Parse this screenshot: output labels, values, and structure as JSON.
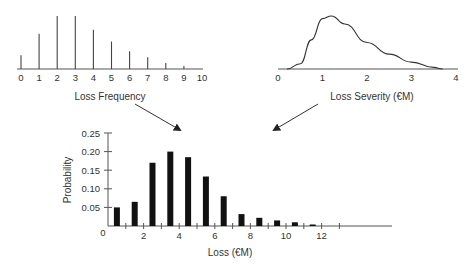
{
  "chart_data": [
    {
      "id": "frequency",
      "type": "bar",
      "title": "",
      "xlabel": "Loss Frequency",
      "ylabel": "",
      "categories": [
        "0",
        "1",
        "2",
        "3",
        "4",
        "5",
        "6",
        "7",
        "8",
        "9",
        "10"
      ],
      "values": [
        0.07,
        0.18,
        0.27,
        0.27,
        0.2,
        0.14,
        0.09,
        0.06,
        0.03,
        0.015,
        0
      ],
      "xticks": [
        "0",
        "1",
        "2",
        "3",
        "4",
        "5",
        "6",
        "7",
        "8",
        "9",
        "10"
      ],
      "grid": false,
      "legend": "none"
    },
    {
      "id": "severity",
      "type": "line",
      "title": "",
      "xlabel": "Loss Severity (€M)",
      "ylabel": "",
      "xticks": [
        "0",
        "1",
        "2",
        "3",
        "4"
      ],
      "x": [
        0.2,
        0.5,
        0.75,
        1.0,
        1.2,
        1.5,
        2.0,
        2.5,
        3.0,
        3.5,
        3.7
      ],
      "y": [
        0.0,
        0.1,
        0.55,
        0.95,
        1.0,
        0.85,
        0.5,
        0.28,
        0.13,
        0.03,
        0.0
      ],
      "grid": false,
      "legend": "none"
    },
    {
      "id": "aggregate",
      "type": "bar",
      "title": "",
      "xlabel": "Loss (€M)",
      "ylabel": "Probability",
      "categories": [
        "0.5",
        "1.5",
        "2.5",
        "3.5",
        "4.5",
        "5.5",
        "6.5",
        "7.5",
        "8.5",
        "9.5",
        "10.5",
        "11.5"
      ],
      "values": [
        0.05,
        0.065,
        0.17,
        0.2,
        0.185,
        0.133,
        0.08,
        0.032,
        0.022,
        0.015,
        0.01,
        0.003
      ],
      "xticks": [
        "0",
        "2",
        "4",
        "6",
        "8",
        "10",
        "12"
      ],
      "yticks": [
        "0.05",
        "0.10",
        "0.15",
        "0.20",
        "0.25"
      ],
      "ylim": [
        0,
        0.25
      ],
      "xlim": [
        0,
        15
      ],
      "grid": false,
      "legend": "none"
    }
  ],
  "labels": {
    "frequency_xlabel": "Loss Frequency",
    "severity_xlabel": "Loss Severity (€M)",
    "aggregate_xlabel": "Loss (€M)",
    "aggregate_ylabel": "Probability",
    "aggregate_origin": "0"
  },
  "colors": {
    "ink": "#222222",
    "axis": "#555555",
    "background": "#ffffff"
  }
}
